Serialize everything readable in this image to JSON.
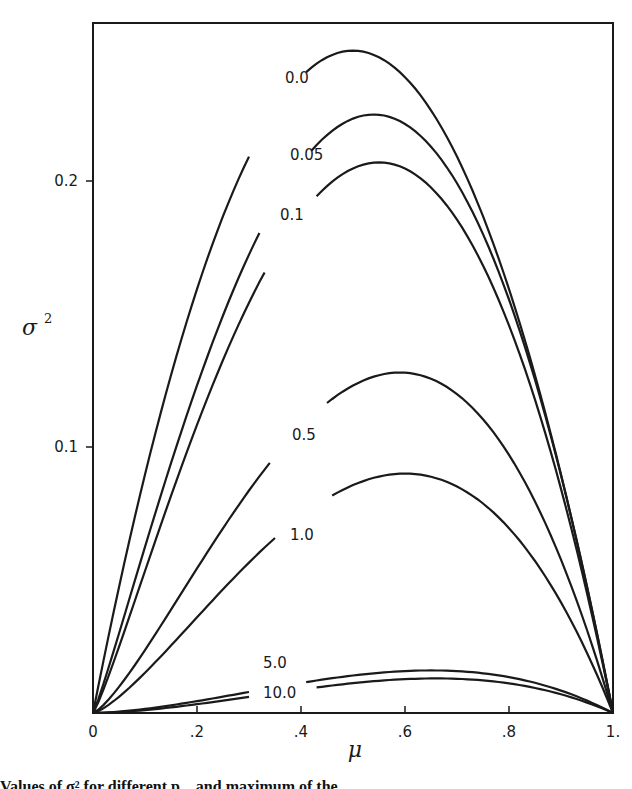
{
  "chart_data": {
    "type": "line",
    "title": "",
    "xlabel": "μ",
    "ylabel": "σ²",
    "xlim": [
      0,
      1
    ],
    "ylim": [
      0,
      0.26
    ],
    "x_ticks": [
      "0",
      ".2",
      ".4",
      ".6",
      ".8",
      "1."
    ],
    "y_ticks": [
      "0.1",
      "0.2"
    ],
    "grid": false,
    "legend": "inline curve labels",
    "series": [
      {
        "name": "0.0",
        "peak_mu": 0.5,
        "peak_sigma2": 0.249
      },
      {
        "name": "0.05",
        "peak_mu": 0.54,
        "peak_sigma2": 0.225
      },
      {
        "name": "0.1",
        "peak_mu": 0.55,
        "peak_sigma2": 0.207
      },
      {
        "name": "0.5",
        "peak_mu": 0.59,
        "peak_sigma2": 0.128
      },
      {
        "name": "1.0",
        "peak_mu": 0.6,
        "peak_sigma2": 0.09
      },
      {
        "name": "5.0",
        "peak_mu": 0.65,
        "peak_sigma2": 0.016
      },
      {
        "name": "10.0",
        "peak_mu": 0.66,
        "peak_sigma2": 0.013
      }
    ]
  },
  "caption": "Values of σ² for different p... and maximum of the...",
  "labels": {
    "x_axis": "μ",
    "y_axis": "σ",
    "y_axis_sup": "2"
  }
}
